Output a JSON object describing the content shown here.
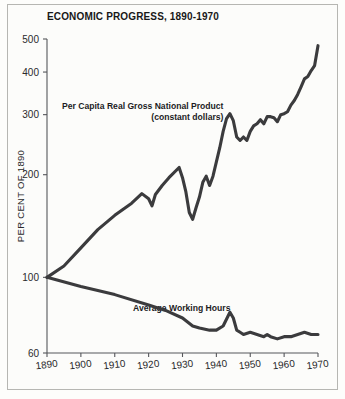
{
  "chart_data": {
    "type": "line",
    "title": "ECONOMIC PROGRESS, 1890-1970",
    "xlabel": "",
    "ylabel": "PER CENT OF 1890",
    "yscale": "log",
    "ylim": [
      60,
      500
    ],
    "xlim": [
      1890,
      1970
    ],
    "yticks": [
      60,
      100,
      200,
      300,
      400,
      500
    ],
    "ytick_labels": [
      "60",
      "100",
      "200",
      "300",
      "400",
      "500"
    ],
    "xticks": [
      1890,
      1900,
      1910,
      1920,
      1930,
      1940,
      1950,
      1960,
      1970
    ],
    "xtick_labels": [
      "1890",
      "1900",
      "1910",
      "1920",
      "1930",
      "1940",
      "1950",
      "1960",
      "1970"
    ],
    "grid": false,
    "legend": "none",
    "annotations": [
      {
        "name": "gnp-label",
        "line1": "Per Capita Real Gross National Product",
        "line2": "(constant dollars)"
      },
      {
        "name": "hours-label",
        "text": "Average Working Hours"
      }
    ],
    "line_color": "#3b3b3d",
    "series": [
      {
        "name": "Per Capita Real Gross National Product (constant dollars)",
        "x": [
          1890,
          1895,
          1900,
          1905,
          1910,
          1915,
          1918,
          1920,
          1921,
          1922,
          1924,
          1926,
          1929,
          1930,
          1931,
          1932,
          1933,
          1934,
          1935,
          1936,
          1937,
          1938,
          1939,
          1941,
          1942,
          1943,
          1944,
          1945,
          1946,
          1947,
          1948,
          1949,
          1950,
          1951,
          1952,
          1953,
          1954,
          1955,
          1956,
          1957,
          1958,
          1959,
          1960,
          1961,
          1962,
          1963,
          1964,
          1965,
          1966,
          1967,
          1968,
          1969,
          1970
        ],
        "values": [
          100,
          108,
          122,
          138,
          152,
          165,
          176,
          170,
          162,
          175,
          186,
          196,
          210,
          196,
          178,
          155,
          148,
          160,
          172,
          190,
          198,
          186,
          198,
          240,
          268,
          292,
          302,
          288,
          258,
          252,
          258,
          252,
          268,
          278,
          282,
          290,
          282,
          296,
          296,
          294,
          286,
          300,
          302,
          306,
          320,
          330,
          344,
          362,
          382,
          388,
          404,
          418,
          478
        ],
        "start_value": 100,
        "end_value": 478,
        "peak_1929": 210,
        "trough_1933": 148,
        "peak_1944": 302
      },
      {
        "name": "Average Working Hours",
        "x": [
          1890,
          1900,
          1910,
          1920,
          1925,
          1930,
          1933,
          1935,
          1938,
          1940,
          1942,
          1944,
          1945,
          1946,
          1947,
          1948,
          1950,
          1952,
          1954,
          1955,
          1956,
          1958,
          1960,
          1962,
          1964,
          1966,
          1968,
          1970
        ],
        "values": [
          100,
          94,
          89,
          83,
          80,
          76,
          72,
          71,
          70,
          70,
          72,
          79,
          76,
          70,
          69,
          68,
          69,
          68,
          67,
          68,
          67,
          66,
          67,
          67,
          68,
          69,
          68,
          68
        ],
        "start_value": 100,
        "end_value": 68
      }
    ]
  }
}
